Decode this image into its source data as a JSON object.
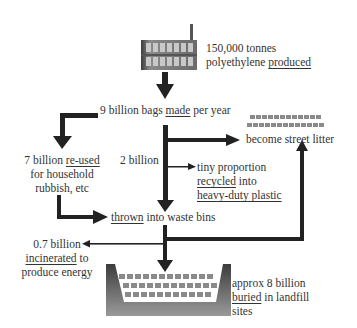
{
  "diagram": {
    "type": "flow",
    "colors": {
      "arrow": "#222222",
      "text": "#333333",
      "factory_dark": "#4a4a4a",
      "factory_light": "#b8b8b8"
    },
    "nodes": {
      "production": {
        "line1": "150,000 tonnes",
        "line2_pre": "polyethylene ",
        "line2_key": "produced"
      },
      "made": {
        "pre": "9 billion bags ",
        "key": "made",
        "post": " per year"
      },
      "reused": {
        "pre": "7 billion ",
        "key": "re-used",
        "line2": "for household",
        "line3": "rubbish, etc"
      },
      "two_billion": {
        "text": "2 billion"
      },
      "recycled": {
        "line1": "tiny proportion",
        "line2_key": "recycled",
        "line2_post": " into",
        "line3": "heavy-duty plastic"
      },
      "litter": {
        "text": "become street litter"
      },
      "thrown": {
        "key": "thrown",
        "post": " into waste bins"
      },
      "incinerated": {
        "line1": "0.7 billion",
        "line2_key": "incinerated",
        "line2_post": " to",
        "line3": "produce energy"
      },
      "landfill": {
        "line1": "approx 8 billion",
        "line2_key": "buried",
        "line2_post": " in landfill",
        "line3": "sites"
      }
    },
    "icons": [
      "factory-icon",
      "street-litter-bags-icon",
      "landfill-pit-icon"
    ]
  }
}
